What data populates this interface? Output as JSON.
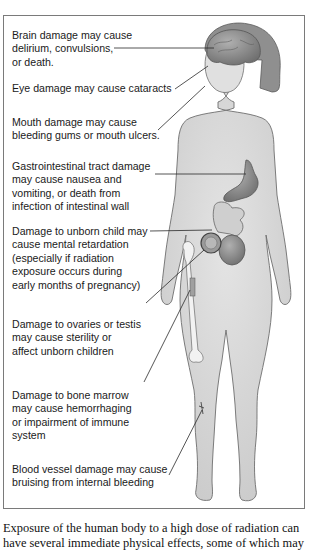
{
  "figure": {
    "labels": [
      {
        "id": "brain",
        "lines": [
          "Brain damage may cause",
          "delirium, convulsions,",
          "or death."
        ]
      },
      {
        "id": "eye",
        "lines": [
          "Eye damage may cause cataracts"
        ]
      },
      {
        "id": "mouth",
        "lines": [
          "Mouth damage may cause",
          "bleeding gums or mouth ulcers."
        ]
      },
      {
        "id": "gi",
        "lines": [
          "Gastrointestinal tract damage",
          "may cause nausea and",
          "vomiting, or death from",
          "infection of intestinal wall"
        ]
      },
      {
        "id": "unborn",
        "lines": [
          "Damage to unborn child may",
          "cause mental retardation",
          "(especially if radiation",
          "exposure occurs during",
          "early months of pregnancy)"
        ]
      },
      {
        "id": "ovaries",
        "lines": [
          "Damage to ovaries or testis",
          "may cause sterility or",
          "affect unborn children"
        ]
      },
      {
        "id": "marrow",
        "lines": [
          "Damage to bone marrow",
          "may cause hemorrhaging",
          "or impairment of immune",
          "system"
        ]
      },
      {
        "id": "vessel",
        "lines": [
          "Blood vessel damage may cause",
          "bruising from internal bleeding"
        ]
      }
    ],
    "colors": {
      "skin": "#d9d9d9",
      "skin_outline": "#6e6e6e",
      "hair": "#8f8f8f",
      "organ": "#8a8a8a",
      "bone": "#f2f2f2",
      "leader_line": "#2a2a2a",
      "frame": "#7a7a7a"
    }
  },
  "caption": {
    "lines": [
      "Exposure of the human body to a high dose of radiation can",
      "have several immediate physical effects, some of which may"
    ]
  }
}
